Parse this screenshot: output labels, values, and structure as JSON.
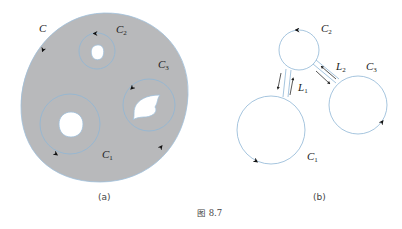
{
  "figure": {
    "caption": "图 8.7",
    "colors": {
      "region_fill": "#b8b9bb",
      "contour_stroke": "#8fb6d6",
      "arrow": "#111111",
      "background": "#ffffff"
    },
    "panel_a": {
      "label": "(a)",
      "outer_contour": {
        "name": "C",
        "sub": ""
      },
      "inner_contours": [
        {
          "name": "C",
          "sub": "1"
        },
        {
          "name": "C",
          "sub": "2"
        },
        {
          "name": "C",
          "sub": "3"
        }
      ]
    },
    "panel_b": {
      "label": "(b)",
      "contours": [
        {
          "name": "C",
          "sub": "1"
        },
        {
          "name": "C",
          "sub": "2"
        },
        {
          "name": "C",
          "sub": "3"
        }
      ],
      "cuts": [
        {
          "name": "L",
          "sub": "1"
        },
        {
          "name": "L",
          "sub": "2"
        }
      ]
    }
  }
}
